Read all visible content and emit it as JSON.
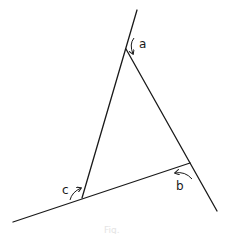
{
  "figure": {
    "type": "triangle-exterior-angles",
    "labels": {
      "a": "a",
      "b": "b",
      "c": "c"
    },
    "caption": "Fig."
  },
  "geometry": {
    "vertices": {
      "top": [
        126,
        49
      ],
      "right": [
        190,
        163
      ],
      "left": [
        82,
        198
      ]
    },
    "extended_lines": [
      {
        "name": "left-side-extended",
        "from": [
          82,
          198
        ],
        "to": [
          137,
          10
        ]
      },
      {
        "name": "right-side-extended",
        "from": [
          126,
          49
        ],
        "to": [
          217,
          211
        ]
      },
      {
        "name": "base-extended",
        "from": [
          190,
          163
        ],
        "to": [
          13,
          222
        ]
      }
    ]
  },
  "colors": {
    "stroke": "#1a1a1a",
    "background": "#ffffff"
  }
}
